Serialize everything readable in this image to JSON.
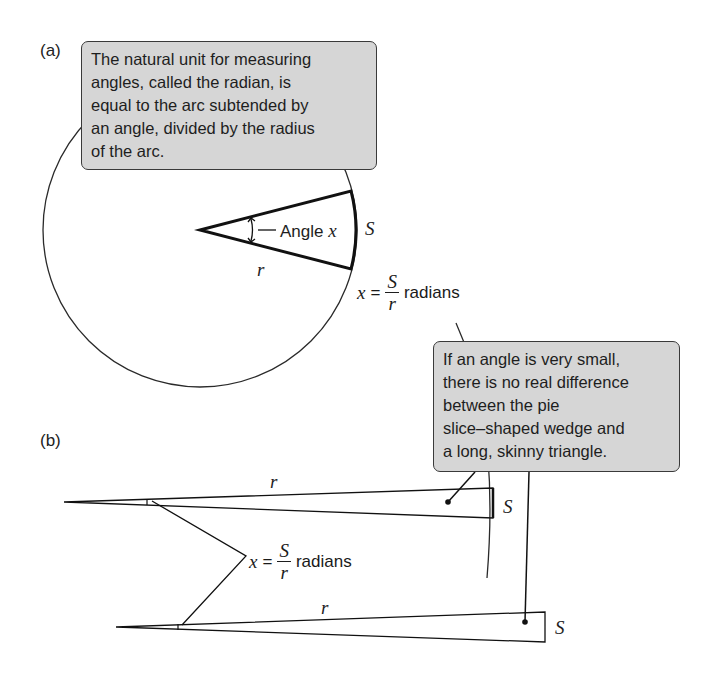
{
  "panel_a": {
    "label": "(a)",
    "callout_text": "The natural unit for measuring\nangles, called the radian, is\nequal to the arc subtended by\nan angle, divided by the radius\nof the arc.",
    "angle_label_prefix": "Angle ",
    "angle_var": "x",
    "radius_label": "r",
    "arc_label": "S",
    "equation": {
      "lhs": "x",
      "equals": "=",
      "numerator": "S",
      "denominator": "r",
      "unit": "radians"
    }
  },
  "panel_b": {
    "label": "(b)",
    "callout_text": "If an angle is very small,\nthere is no real difference\nbetween the pie\nslice–shaped wedge and\na long, skinny triangle.",
    "wedge_radius_label": "r",
    "wedge_arc_label": "S",
    "triangle_radius_label": "r",
    "triangle_side_label": "S",
    "equation": {
      "lhs": "x",
      "equals": "=",
      "numerator": "S",
      "denominator": "r",
      "unit": "radians"
    }
  },
  "colors": {
    "callout_fill": "#d6d6d6",
    "stroke": "#1e1e1e"
  }
}
